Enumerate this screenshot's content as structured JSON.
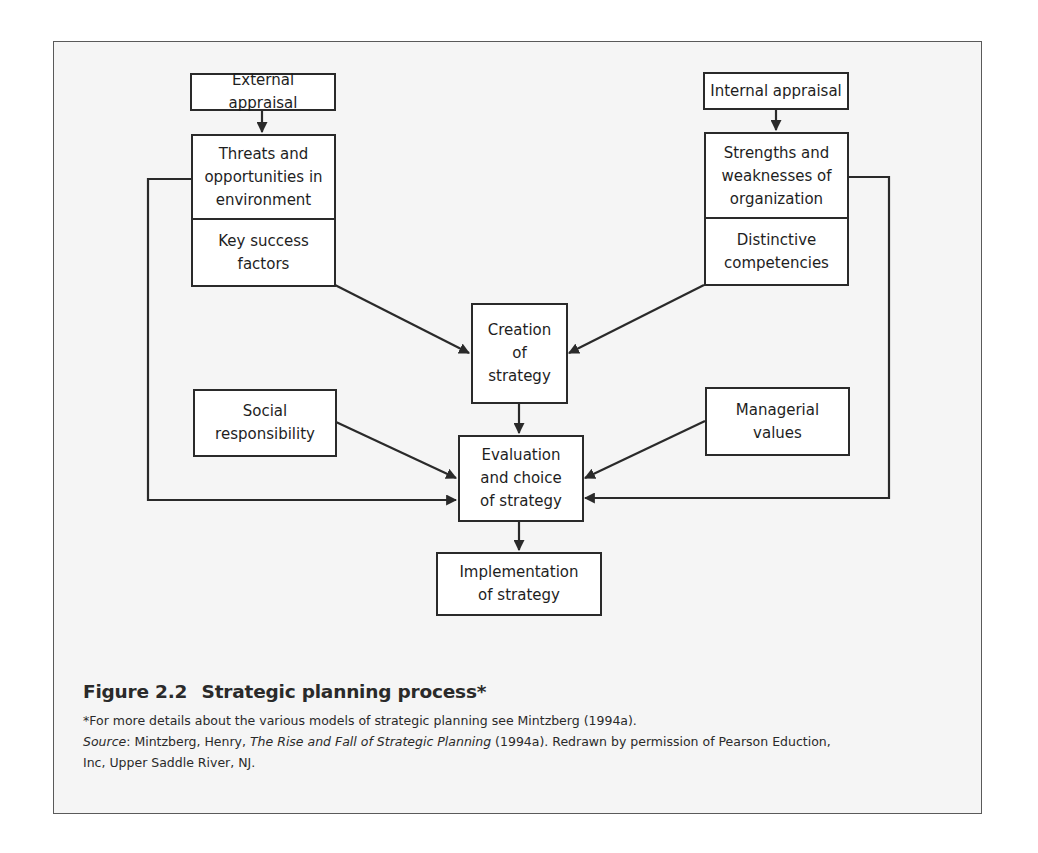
{
  "figure": {
    "number": "Figure 2.2",
    "title": "Strategic planning process*",
    "footnote": "*For more details about the various models of strategic planning see Mintzberg (1994a).",
    "source_label": "Source",
    "source_sep": ": Mintzberg, Henry, ",
    "source_book": "The Rise and Fall of Strategic Planning",
    "source_rest_line1": " (1994a). Redrawn by permission of Pearson Eduction,",
    "source_line2": "Inc, Upper Saddle River, NJ."
  },
  "nodes": {
    "external_appraisal": "External appraisal",
    "threats_opportunities": "Threats and opportunities in environment",
    "key_success_factors": "Key success factors",
    "internal_appraisal": "Internal appraisal",
    "strengths_weaknesses": "Strengths and weaknesses of organization",
    "distinctive_competencies": "Distinctive competencies",
    "creation_of_strategy": "Creation of strategy",
    "social_responsibility": "Social responsibility",
    "managerial_values": "Managerial values",
    "evaluation_choice": "Evaluation and choice of strategy",
    "implementation": "Implementation of strategy"
  },
  "node_lines": {
    "threats": [
      "Threats and",
      "opportunities in",
      "environment"
    ],
    "key_success": [
      "Key success",
      "factors"
    ],
    "strengths": [
      "Strengths and",
      "weaknesses of",
      "organization"
    ],
    "distinctive": [
      "Distinctive",
      "competencies"
    ],
    "creation": [
      "Creation",
      "of",
      "strategy"
    ],
    "social": [
      "Social",
      "responsibility"
    ],
    "managerial": [
      "Managerial",
      "values"
    ],
    "evaluation": [
      "Evaluation",
      "and choice",
      "of strategy"
    ],
    "implementation": [
      "Implementation",
      "of strategy"
    ]
  },
  "edges": [
    {
      "from": "External appraisal",
      "to": "Threats and opportunities in environment"
    },
    {
      "from": "Internal appraisal",
      "to": "Strengths and weaknesses of organization"
    },
    {
      "from": "Key success factors",
      "to": "Creation of strategy"
    },
    {
      "from": "Distinctive competencies",
      "to": "Creation of strategy"
    },
    {
      "from": "Creation of strategy",
      "to": "Evaluation and choice of strategy"
    },
    {
      "from": "Social responsibility",
      "to": "Evaluation and choice of strategy"
    },
    {
      "from": "Managerial values",
      "to": "Evaluation and choice of strategy"
    },
    {
      "from": "Threats and opportunities in environment",
      "to": "Evaluation and choice of strategy"
    },
    {
      "from": "Strengths and weaknesses of organization",
      "to": "Evaluation and choice of strategy"
    },
    {
      "from": "Evaluation and choice of strategy",
      "to": "Implementation of strategy"
    }
  ],
  "colors": {
    "frame_bg": "#f5f5f5",
    "box_bg": "#ffffff",
    "stroke": "#2a2a2a"
  }
}
